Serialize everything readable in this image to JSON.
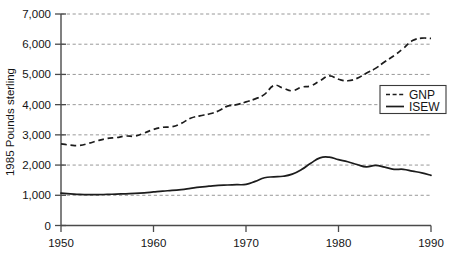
{
  "chart_data": {
    "type": "line",
    "title": "",
    "xlabel": "",
    "ylabel": "1985 Pounds sterling",
    "xlim": [
      1950,
      1990
    ],
    "ylim": [
      0,
      7000
    ],
    "grid": true,
    "legend_position": "right-middle",
    "x_ticks": [
      "1950",
      "1960",
      "1970",
      "1980",
      "1990"
    ],
    "x_tick_values": [
      1950,
      1960,
      1970,
      1980,
      1990
    ],
    "y_ticks": [
      "0",
      "1,000",
      "2,000",
      "3,000",
      "4,000",
      "5,000",
      "6,000",
      "7,000"
    ],
    "y_tick_values": [
      0,
      1000,
      2000,
      3000,
      4000,
      5000,
      6000,
      7000
    ],
    "x": [
      1950,
      1951,
      1952,
      1953,
      1954,
      1955,
      1956,
      1957,
      1958,
      1959,
      1960,
      1961,
      1962,
      1963,
      1964,
      1965,
      1966,
      1967,
      1968,
      1969,
      1970,
      1971,
      1972,
      1973,
      1974,
      1975,
      1976,
      1977,
      1978,
      1979,
      1980,
      1981,
      1982,
      1983,
      1984,
      1985,
      1986,
      1987,
      1988,
      1989,
      1990
    ],
    "series": [
      {
        "name": "GNP",
        "style": "dashed",
        "values": [
          2700,
          2660,
          2650,
          2720,
          2810,
          2880,
          2910,
          2960,
          2960,
          3060,
          3180,
          3250,
          3270,
          3380,
          3550,
          3630,
          3690,
          3790,
          3950,
          4000,
          4090,
          4190,
          4340,
          4630,
          4550,
          4460,
          4580,
          4620,
          4790,
          4950,
          4840,
          4790,
          4870,
          5040,
          5200,
          5420,
          5620,
          5860,
          6120,
          6200,
          6190
        ]
      },
      {
        "name": "ISEW",
        "style": "solid",
        "values": [
          1070,
          1050,
          1030,
          1020,
          1020,
          1030,
          1040,
          1050,
          1060,
          1080,
          1110,
          1140,
          1160,
          1190,
          1230,
          1270,
          1300,
          1330,
          1340,
          1350,
          1360,
          1460,
          1580,
          1610,
          1630,
          1700,
          1850,
          2060,
          2240,
          2260,
          2180,
          2110,
          2020,
          1940,
          1990,
          1930,
          1860,
          1860,
          1800,
          1740,
          1660
        ]
      }
    ]
  },
  "legend": {
    "entries": [
      {
        "label": "GNP",
        "style": "dashed"
      },
      {
        "label": "ISEW",
        "style": "solid"
      }
    ]
  }
}
